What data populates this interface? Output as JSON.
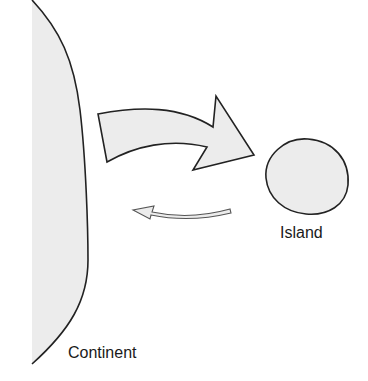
{
  "diagram": {
    "type": "island-continent migration diagram",
    "labels": {
      "island": "Island",
      "continent": "Continent"
    },
    "shapes": {
      "continent": {
        "fill": "#ececec",
        "stroke": "#222222"
      },
      "island": {
        "fill": "#ececec",
        "stroke": "#222222"
      },
      "large_arrow": {
        "direction": "continent-to-island",
        "fill": "#ececec",
        "stroke": "#222222"
      },
      "small_arrow": {
        "direction": "island-to-continent",
        "fill": "#ececec",
        "stroke": "#555555"
      }
    }
  }
}
